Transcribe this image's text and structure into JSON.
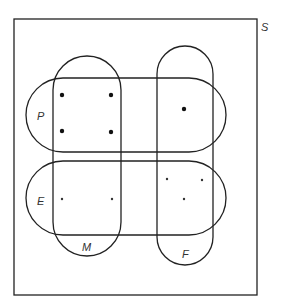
{
  "diagram": {
    "universe_label": "S",
    "sets": [
      {
        "id": "P",
        "label": "P"
      },
      {
        "id": "E",
        "label": "E"
      },
      {
        "id": "M",
        "label": "M"
      },
      {
        "id": "F",
        "label": "F"
      }
    ],
    "markers": {
      "P_and_M": {
        "symbol": "dot",
        "count": 4
      },
      "P_and_F": {
        "symbol": "dot",
        "count": 1
      },
      "E_and_M": {
        "symbol": "star",
        "count": 2
      },
      "E_and_F": {
        "symbol": "star",
        "count": 3
      }
    },
    "colors": {
      "stroke": "#222222",
      "background": "#ffffff"
    }
  }
}
